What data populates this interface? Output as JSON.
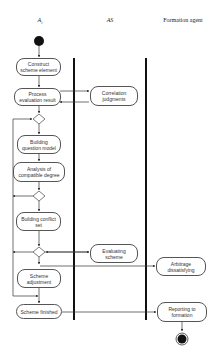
{
  "lanes": [
    {
      "title": "A",
      "subscript": "i",
      "italic": true
    },
    {
      "title": "AS",
      "italic": true
    },
    {
      "title": "Formation agent",
      "italic": false
    }
  ],
  "nodes": {
    "construct": "Construct scheme element",
    "process": "Process evaluation result",
    "correlation": "Correlation judgments",
    "building_question": "Building question model",
    "analysis": "Analysis of compatible degree",
    "building_conflict": "Building conflict set",
    "evaluating": "Evaluating scheme",
    "arbitrage": "Arbitrage dissatisfying",
    "adjustment": "Scheme adjustment",
    "finished": "Scheme finished",
    "reporting": "Reporting to formation"
  }
}
